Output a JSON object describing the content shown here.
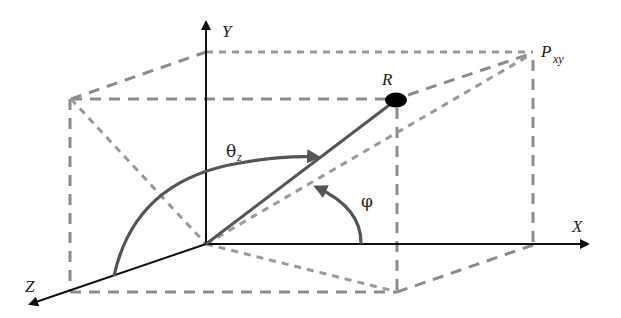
{
  "diagram": {
    "type": "3d-coordinate-system",
    "labels": {
      "y_axis": "Y",
      "x_axis": "X",
      "z_axis": "Z",
      "point": "R",
      "projection_main": "P",
      "projection_sub": "xy",
      "theta_main": "θ",
      "theta_sub": "z",
      "phi": "φ"
    },
    "colors": {
      "axis": "#111111",
      "vector": "#555555",
      "dashed_box": "#8c8c8c",
      "point": "#000000"
    }
  }
}
